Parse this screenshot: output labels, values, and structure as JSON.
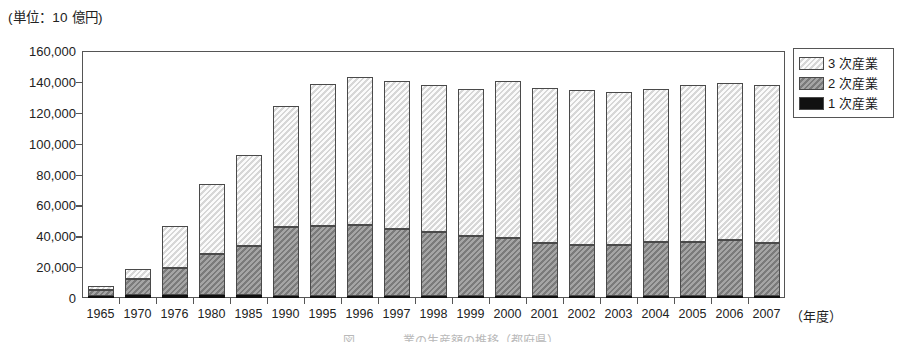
{
  "unit_label": "(単位：10 億円)",
  "x_axis_title": "（年度）",
  "bottom_caption": "図　　　　業の生産額の推移（都府県）",
  "legend": {
    "items": [
      {
        "label": "3 次産業",
        "color": "#e3e3e3",
        "key": "tertiary"
      },
      {
        "label": "2 次産業",
        "color": "#8c8c8c",
        "key": "secondary"
      },
      {
        "label": "1 次産業",
        "color": "#111111",
        "key": "primary"
      }
    ]
  },
  "chart_data": {
    "type": "bar",
    "stacked": true,
    "title": "",
    "subtitle": "",
    "xlabel": "（年度）",
    "ylabel": "(単位：10 億円)",
    "ylim": [
      0,
      160000
    ],
    "ytick_labels": [
      "160,000",
      "140,000",
      "120,000",
      "100,000",
      "80,000",
      "60,000",
      "40,000",
      "20,000",
      "0"
    ],
    "yticks": [
      160000,
      140000,
      120000,
      100000,
      80000,
      60000,
      40000,
      20000,
      0
    ],
    "grid": false,
    "legend_position": "right",
    "categories": [
      "1965",
      "1970",
      "1976",
      "1980",
      "1985",
      "1990",
      "1995",
      "1996",
      "1997",
      "1998",
      "1999",
      "2000",
      "2001",
      "2002",
      "2003",
      "2004",
      "2005",
      "2006",
      "2007"
    ],
    "series": [
      {
        "name": "1 次産業",
        "color": "#111111",
        "values": [
          1200,
          1700,
          1800,
          1800,
          1700,
          1600,
          1400,
          1300,
          1300,
          1200,
          1200,
          1100,
          1100,
          1000,
          1000,
          1000,
          1000,
          1000,
          1000
        ]
      },
      {
        "name": "2 次産業",
        "color": "#8c8c8c",
        "values": [
          4000,
          10500,
          17500,
          26500,
          32000,
          44500,
          45500,
          46000,
          43500,
          41500,
          39000,
          38000,
          34500,
          33500,
          33500,
          35000,
          35000,
          36500,
          34500
        ]
      },
      {
        "name": "3 次産業",
        "color": "#e3e3e3",
        "values": [
          2300,
          6300,
          27200,
          45700,
          58800,
          78400,
          91600,
          95700,
          95700,
          95300,
          95300,
          101400,
          100400,
          100000,
          99000,
          99500,
          102000,
          102000,
          102500
        ]
      }
    ],
    "totals": [
      7500,
      18500,
      46500,
      74000,
      92500,
      124500,
      138500,
      143000,
      140500,
      138000,
      135500,
      140500,
      136000,
      134500,
      133500,
      135500,
      138000,
      139500,
      138000
    ]
  }
}
